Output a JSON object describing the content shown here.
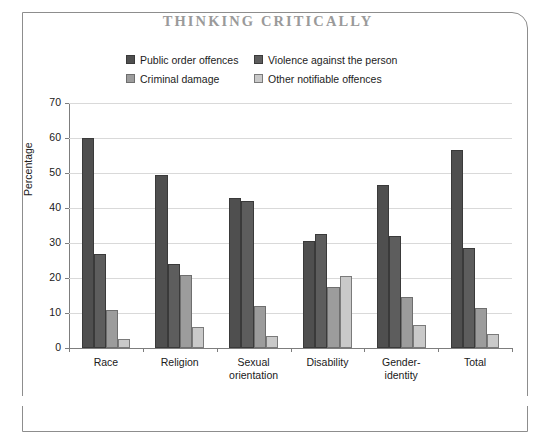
{
  "frame": {
    "title": "THINKING CRITICALLY"
  },
  "legend": {
    "items": [
      {
        "label": "Public order offences",
        "color": "#4f4f4f",
        "border": "#3a3a3a"
      },
      {
        "label": "Violence against the person",
        "color": "#5d5d5d",
        "border": "#3a3a3a"
      },
      {
        "label": "Criminal damage",
        "color": "#9c9c9c",
        "border": "#6e6e6e"
      },
      {
        "label": "Other notifiable offences",
        "color": "#c9c9c9",
        "border": "#7a7a7a"
      }
    ]
  },
  "chart_data": {
    "type": "bar",
    "title": "THINKING CRITICALLY",
    "xlabel": "",
    "ylabel": "Percentage",
    "ylim": [
      0,
      70
    ],
    "ytick_step": 10,
    "yticks": [
      0,
      10,
      20,
      30,
      40,
      50,
      60,
      70
    ],
    "grid": true,
    "legend_position": "top-center",
    "categories": [
      "Race",
      "Religion",
      "Sexual\norientation",
      "Disability",
      "Gender-\nidentity",
      "Total"
    ],
    "series": [
      {
        "name": "Public order offences",
        "color": "#4f4f4f",
        "border": "#3a3a3a",
        "values": [
          60.0,
          49.5,
          43.0,
          30.5,
          46.5,
          56.5
        ]
      },
      {
        "name": "Violence against the person",
        "color": "#5d5d5d",
        "border": "#3a3a3a",
        "values": [
          27.0,
          24.0,
          42.0,
          32.5,
          32.0,
          28.5
        ]
      },
      {
        "name": "Criminal damage",
        "color": "#9c9c9c",
        "border": "#6e6e6e",
        "values": [
          11.0,
          21.0,
          12.0,
          17.5,
          14.5,
          11.5
        ]
      },
      {
        "name": "Other notifiable offences",
        "color": "#c9c9c9",
        "border": "#7a7a7a",
        "values": [
          2.5,
          6.0,
          3.5,
          20.5,
          6.5,
          4.0
        ]
      }
    ]
  }
}
